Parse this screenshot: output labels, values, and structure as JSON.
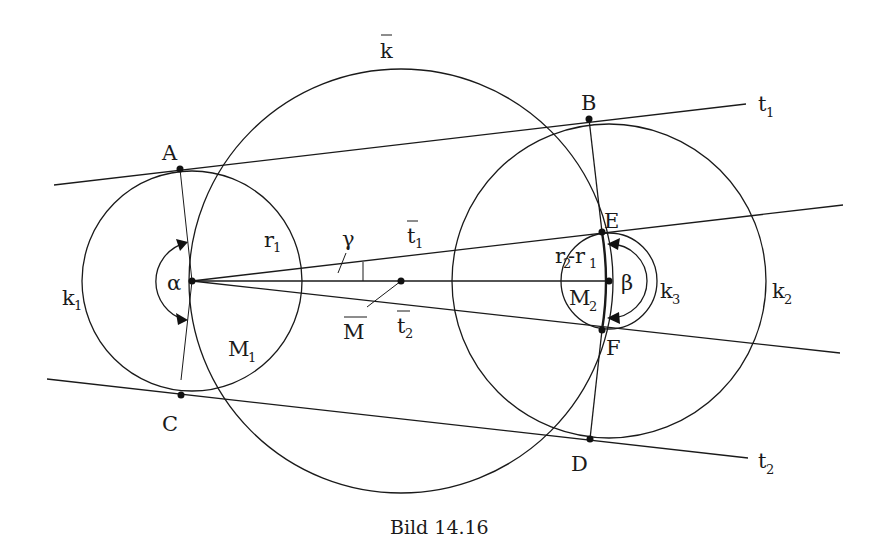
{
  "caption": "Bild 14.16",
  "labels": {
    "k_bar": "k",
    "k1": "k",
    "k1_sub": "1",
    "k2": "k",
    "k2_sub": "2",
    "k3": "k",
    "k3_sub": "3",
    "t1": "t",
    "t1_sub": "1",
    "t2": "t",
    "t2_sub": "2",
    "t1_bar": "t",
    "t1_bar_sub": "1",
    "t2_bar": "t",
    "t2_bar_sub": "2",
    "M_bar": "M",
    "M1": "M",
    "M1_sub": "1",
    "M2": "M",
    "M2_sub": "2",
    "r1": "r",
    "r1_sub": "1",
    "r2_minus_r1_a": "r",
    "r2_minus_r1_a_sub": "2",
    "r2_minus_r1_dash": "-r",
    "r2_minus_r1_b_sub": "1",
    "A": "A",
    "B": "B",
    "C": "C",
    "D": "D",
    "E": "E",
    "F": "F",
    "alpha": "α",
    "beta": "β",
    "gamma": "γ"
  },
  "geometry": {
    "circles": [
      {
        "name": "k1",
        "cx": 192,
        "cy": 281,
        "r": 110
      },
      {
        "name": "k_bar",
        "cx": 401,
        "cy": 281,
        "r": 212
      },
      {
        "name": "k2",
        "cx": 609,
        "cy": 281,
        "r": 157
      },
      {
        "name": "k3",
        "cx": 609,
        "cy": 281,
        "r": 48
      }
    ],
    "points": {
      "A": [
        180,
        169
      ],
      "B": [
        589,
        119
      ],
      "C": [
        181,
        395
      ],
      "D": [
        590,
        439
      ],
      "E": [
        602,
        232
      ],
      "F": [
        602,
        330
      ],
      "M1": [
        192,
        281
      ],
      "M2": [
        609,
        281
      ],
      "M_bar": [
        401,
        281
      ]
    }
  }
}
